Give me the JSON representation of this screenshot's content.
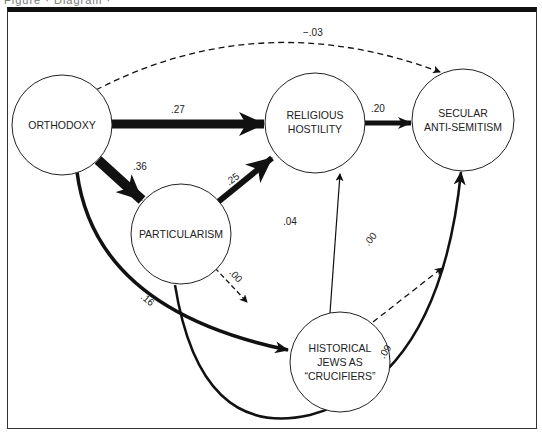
{
  "header": {
    "caption_fragment": "Figure · Diagram ·"
  },
  "diagram": {
    "type": "path-diagram",
    "nodes": [
      {
        "id": "orthodoxy",
        "lines": [
          "ORTHODOXY"
        ]
      },
      {
        "id": "religious_hostility",
        "lines": [
          "RELIGIOUS",
          "HOSTILITY"
        ]
      },
      {
        "id": "secular_antisemitism",
        "lines": [
          "SECULAR",
          "ANTI-SEMITISM"
        ]
      },
      {
        "id": "particularism",
        "lines": [
          "PARTICULARISM"
        ]
      },
      {
        "id": "historical_jews",
        "lines": [
          "HISTORICAL",
          "JEWS AS",
          "“CRUCIFIERS”"
        ]
      }
    ],
    "edges": [
      {
        "from": "orthodoxy",
        "to": "secular_antisemitism",
        "coef": "−.03",
        "style": "dashed"
      },
      {
        "from": "orthodoxy",
        "to": "religious_hostility",
        "coef": ".27",
        "style": "thick"
      },
      {
        "from": "orthodoxy",
        "to": "particularism",
        "coef": ".36",
        "style": "thick"
      },
      {
        "from": "orthodoxy",
        "to": "historical_jews",
        "coef": ".16",
        "style": "medium"
      },
      {
        "from": "particularism",
        "to": "religious_hostility",
        "coef": ".25",
        "style": "thick"
      },
      {
        "from": "particularism",
        "to": "historical_jews",
        "coef": ".00",
        "style": "dashed"
      },
      {
        "from": "particularism",
        "to": "secular_antisemitism",
        "coef": ".09",
        "style": "medium"
      },
      {
        "from": "religious_hostility",
        "to": "secular_antisemitism",
        "coef": ".20",
        "style": "thick"
      },
      {
        "from": "historical_jews",
        "to": "religious_hostility",
        "coef": ".04",
        "style": "thin"
      },
      {
        "from": "historical_jews",
        "to": "secular_antisemitism",
        "coef": ".00",
        "style": "dashed"
      }
    ]
  },
  "labels": {
    "n_orthodoxy": "ORTHODOXY",
    "n_rh_1": "RELIGIOUS",
    "n_rh_2": "HOSTILITY",
    "n_sa_1": "SECULAR",
    "n_sa_2": "ANTI-SEMITISM",
    "n_part": "PARTICULARISM",
    "n_hj_1": "HISTORICAL",
    "n_hj_2": "JEWS AS",
    "n_hj_3": "“CRUCIFIERS”",
    "c_ortho_secular": "−.03",
    "c_ortho_rh": ".27",
    "c_ortho_part": ".36",
    "c_ortho_hj": ".16",
    "c_part_rh": ".25",
    "c_part_hj": ".00",
    "c_part_secular": ".09",
    "c_rh_secular": ".20",
    "c_hj_rh": ".04",
    "c_hj_secular": ".00"
  },
  "colors": {
    "ink": "#111111",
    "background": "#ffffff"
  }
}
